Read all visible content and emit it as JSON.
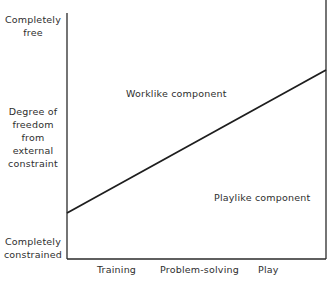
{
  "diagram": {
    "y_axis": {
      "top_label_line1": "Completely",
      "top_label_line2": "free",
      "title_line1": "Degree of",
      "title_line2": "freedom",
      "title_line3": "from",
      "title_line4": "external",
      "title_line5": "constraint",
      "bottom_label_line1": "Completely",
      "bottom_label_line2": "constrained"
    },
    "x_axis": {
      "categories": [
        "Training",
        "Problem-solving",
        "Play"
      ]
    },
    "regions": {
      "upper": "Worklike component",
      "lower": "Playlike component"
    },
    "dividing_line": {
      "start": "Training, near constrained",
      "end": "Play, near free"
    }
  }
}
